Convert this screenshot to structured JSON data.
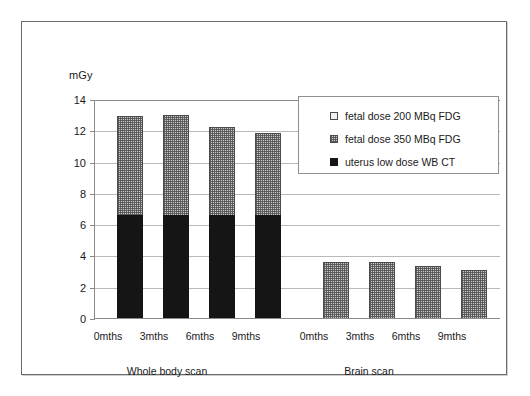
{
  "figure": {
    "axis_unit_label": "mGy",
    "group_labels": [
      "Whole body scan",
      "Brain scan"
    ]
  },
  "legend": {
    "items": [
      {
        "label": "fetal dose 200 MBq FDG",
        "swatch": "white-square-icon",
        "color": "#f2f2f2"
      },
      {
        "label": "fetal dose 350 MBq FDG",
        "swatch": "dotted-grey-square-icon",
        "color": "#c9c9c9"
      },
      {
        "label": "uterus low dose WB CT",
        "swatch": "black-square-icon",
        "color": "#151515"
      }
    ]
  },
  "chart_data": {
    "type": "bar",
    "title": "",
    "xlabel": "",
    "ylabel": "mGy",
    "ylim": [
      0,
      14
    ],
    "yticks": [
      0,
      2,
      4,
      6,
      8,
      10,
      12,
      14
    ],
    "grid": true,
    "legend_position": "top-right",
    "stacked": true,
    "groups": [
      "Whole body scan",
      "Brain scan"
    ],
    "categories": [
      "0mths",
      "3mths",
      "6mths",
      "9mths"
    ],
    "series": [
      {
        "name": "uterus low dose WB CT",
        "color": "#151515",
        "values_whole_body": [
          6.6,
          6.6,
          6.6,
          6.6
        ],
        "values_brain": [
          0,
          0,
          0,
          0
        ]
      },
      {
        "name": "fetal dose 350 MBq FDG",
        "color": "#c9c9c9",
        "values_whole_body": [
          6.3,
          6.4,
          5.6,
          5.2
        ],
        "values_brain": [
          3.6,
          3.6,
          3.3,
          3.1
        ]
      },
      {
        "name": "fetal dose 200 MBq FDG",
        "color": "#f2f2f2",
        "values_whole_body": [
          0,
          0,
          0,
          0
        ],
        "values_brain": [
          0,
          0,
          0,
          0
        ]
      }
    ],
    "bar_totals": {
      "Whole body scan": [
        12.9,
        13.0,
        12.2,
        11.8
      ],
      "Brain scan": [
        3.6,
        3.6,
        3.3,
        3.1
      ]
    }
  }
}
